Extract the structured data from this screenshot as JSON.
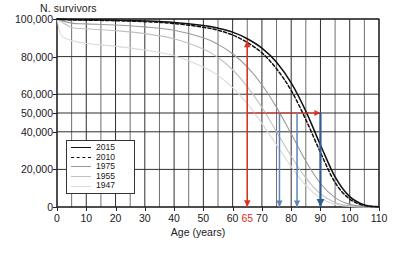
{
  "chart_data": {
    "type": "line",
    "title": "",
    "ylabel": "N. survivors",
    "xlabel": "Age (years)",
    "xlim": [
      0,
      110
    ],
    "ylim": [
      0,
      100000
    ],
    "xticks": [
      0,
      10,
      20,
      30,
      40,
      50,
      60,
      65,
      70,
      80,
      90,
      100,
      110
    ],
    "xtick_labels": [
      "0",
      "10",
      "20",
      "30",
      "40",
      "50",
      "60",
      "65",
      "70",
      "80",
      "90",
      "100",
      "110"
    ],
    "highlighted_xtick": "65",
    "highlighted_xtick_color": "#e03020",
    "yticks": [
      0,
      20000,
      40000,
      50000,
      60000,
      80000,
      100000
    ],
    "ytick_labels": [
      "0",
      "20,000",
      "40,000",
      "50,000",
      "60,000",
      "80,000",
      "100,000"
    ],
    "grid": "both, minor vertical every 5 years",
    "legend_position": "lower-left inside axes",
    "series": [
      {
        "name": "2015",
        "style": "solid",
        "color": "#111111",
        "x": [
          0,
          5,
          10,
          20,
          30,
          40,
          50,
          55,
          60,
          65,
          70,
          75,
          80,
          85,
          90,
          95,
          100,
          105,
          110
        ],
        "values": [
          100000,
          99700,
          99600,
          99400,
          99000,
          98200,
          96500,
          95100,
          93000,
          89500,
          84500,
          77000,
          66000,
          51000,
          33000,
          16000,
          5500,
          1100,
          100
        ]
      },
      {
        "name": "2010",
        "style": "dashed",
        "color": "#111111",
        "x": [
          0,
          5,
          10,
          20,
          30,
          40,
          50,
          55,
          60,
          65,
          70,
          75,
          80,
          85,
          90,
          95,
          100,
          105,
          110
        ],
        "values": [
          100000,
          99500,
          99400,
          99100,
          98600,
          97600,
          95600,
          94000,
          91500,
          87500,
          82000,
          73500,
          62000,
          46500,
          29000,
          13000,
          4200,
          800,
          60
        ]
      },
      {
        "name": "1975",
        "style": "solid",
        "color": "#9a9a9a",
        "x": [
          0,
          5,
          10,
          20,
          30,
          40,
          50,
          55,
          60,
          65,
          70,
          75,
          80,
          85,
          90,
          95,
          100,
          105,
          110
        ],
        "values": [
          100000,
          97800,
          97400,
          96800,
          95800,
          94000,
          90000,
          86500,
          81500,
          74500,
          65000,
          53000,
          39000,
          24500,
          12500,
          5000,
          1400,
          250,
          20
        ]
      },
      {
        "name": "1955",
        "style": "solid",
        "color": "#c2c2c2",
        "x": [
          0,
          5,
          10,
          20,
          30,
          40,
          50,
          55,
          60,
          65,
          70,
          75,
          80,
          85,
          90,
          95,
          100,
          105,
          110
        ],
        "values": [
          100000,
          95500,
          94800,
          93800,
          92200,
          89500,
          84000,
          79500,
          73000,
          64000,
          53000,
          40000,
          27000,
          15500,
          7000,
          2400,
          600,
          90,
          8
        ]
      },
      {
        "name": "1947",
        "style": "solid",
        "color": "#dadada",
        "x": [
          0,
          1,
          2,
          5,
          10,
          20,
          30,
          40,
          50,
          55,
          60,
          65,
          70,
          75,
          80,
          85,
          90,
          95,
          100,
          105,
          110
        ],
        "values": [
          100000,
          93000,
          90500,
          88500,
          87000,
          85500,
          83500,
          80500,
          74500,
          70000,
          63500,
          55000,
          44500,
          33000,
          21500,
          11500,
          4800,
          1500,
          330,
          40,
          4
        ]
      }
    ],
    "annotations": [
      {
        "name": "red-vertical-double-arrow",
        "kind": "double-arrow-vertical",
        "x": 65,
        "y_from": 0,
        "y_to": 88500,
        "color": "#e03020",
        "meaning": "survivors at age 65"
      },
      {
        "name": "red-horizontal-arrow",
        "kind": "arrow-horizontal",
        "y": 50000,
        "x_from": 65,
        "x_to": 90,
        "color": "#e03020",
        "meaning": "median remaining survival from age 65"
      },
      {
        "name": "blue-arrow-1955",
        "kind": "arrow-down",
        "x": 76,
        "y_from": 50000,
        "y_to": 0,
        "color": "#5b86b5",
        "meaning": "age at 50,000 survivors, 1955"
      },
      {
        "name": "blue-arrow-1975",
        "kind": "arrow-down",
        "x": 82,
        "y_from": 50000,
        "y_to": 0,
        "color": "#5b86b5",
        "meaning": "age at 50,000 survivors, 1975"
      },
      {
        "name": "blue-arrow-2015",
        "kind": "arrow-down",
        "x": 90,
        "y_from": 50000,
        "y_to": 0,
        "color": "#2f5d96",
        "meaning": "age at 50,000 survivors, 2015"
      }
    ]
  },
  "legend": {
    "items": [
      {
        "label": "2015",
        "style": "solid",
        "color": "#111111"
      },
      {
        "label": "2010",
        "style": "dashed",
        "color": "#111111"
      },
      {
        "label": "1975",
        "style": "solid",
        "color": "#9a9a9a"
      },
      {
        "label": "1955",
        "style": "solid",
        "color": "#c2c2c2"
      },
      {
        "label": "1947",
        "style": "solid",
        "color": "#dadada"
      }
    ]
  },
  "caption": ""
}
